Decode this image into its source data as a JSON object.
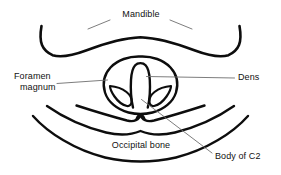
{
  "diagram": {
    "type": "anatomical-line-drawing",
    "view": "axial skull base",
    "background_color": "#ffffff",
    "stroke_color": "#0d0d0d",
    "leader_color": "#6e6e6e",
    "labels": {
      "mandible": "Mandible",
      "foramen_magnum_line1": "Foramen",
      "foramen_magnum_line2": "magnum",
      "dens": "Dens",
      "occipital_bone": "Occipital bone",
      "body_of_c2": "Body of C2"
    },
    "structures": [
      "mandible-arch",
      "foramen-magnum-outline",
      "dens",
      "lateral-mass-left",
      "lateral-mass-right",
      "occipital-arc-inner",
      "occipital-arc-middle",
      "occipital-arc-outer",
      "body-of-c2-peak"
    ]
  }
}
